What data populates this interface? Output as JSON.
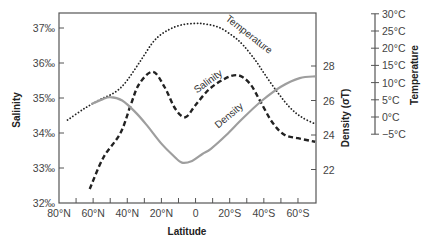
{
  "chart_data": {
    "type": "line",
    "title": "",
    "xlabel": "Latitude",
    "ylabel": "Salinity",
    "y2label": "Density (σT)",
    "y3label": "Temperature",
    "xlim": [
      80,
      -70
    ],
    "x_ticks": [
      {
        "value": 80,
        "label": "80°N"
      },
      {
        "value": 60,
        "label": "60°N"
      },
      {
        "value": 40,
        "label": "40°N"
      },
      {
        "value": 20,
        "label": "20°N"
      },
      {
        "value": 0,
        "label": "0"
      },
      {
        "value": -20,
        "label": "20°S"
      },
      {
        "value": -40,
        "label": "40°S"
      },
      {
        "value": -60,
        "label": "60°S"
      }
    ],
    "x_minor_ticks": [
      70,
      50,
      30,
      10,
      -10,
      -30,
      -50
    ],
    "salinity_axis": {
      "ylim": [
        32,
        37.4
      ],
      "ticks": [
        {
          "value": 37,
          "label": "37‰"
        },
        {
          "value": 36,
          "label": "36‰"
        },
        {
          "value": 35,
          "label": "35‰"
        },
        {
          "value": 34,
          "label": "34‰"
        },
        {
          "value": 33,
          "label": "33‰"
        },
        {
          "value": 32,
          "label": "32‰"
        }
      ]
    },
    "density_axis": {
      "ylim": [
        20,
        28
      ],
      "ticks": [
        {
          "value": 28,
          "label": "28"
        },
        {
          "value": 26,
          "label": "26"
        },
        {
          "value": 24,
          "label": "24"
        },
        {
          "value": 22,
          "label": "22"
        }
      ]
    },
    "temperature_axis": {
      "ylim": [
        -5,
        30
      ],
      "ticks": [
        {
          "value": 30,
          "label": "30°C"
        },
        {
          "value": 25,
          "label": "25°C"
        },
        {
          "value": 20,
          "label": "20°C"
        },
        {
          "value": 15,
          "label": "15°C"
        },
        {
          "value": 10,
          "label": "10°C"
        },
        {
          "value": 5,
          "label": "5°C"
        },
        {
          "value": 0,
          "label": "0°C"
        },
        {
          "value": -5,
          "label": "−5°C"
        }
      ]
    },
    "series": [
      {
        "name": "Temperature",
        "axis": "temperature",
        "style": "dotted",
        "color": "#222222",
        "x": [
          75,
          65,
          55,
          50,
          45,
          40,
          32,
          24,
          16,
          8,
          0,
          -6,
          -14,
          -22,
          -28,
          -35,
          -41,
          -48,
          -55,
          -62,
          -70
        ],
        "values": [
          -0.9,
          2.5,
          5.3,
          6.4,
          8.0,
          10.7,
          16.5,
          22.3,
          25.3,
          26.8,
          27.2,
          27.0,
          26.0,
          23.5,
          20.8,
          16.5,
          12.1,
          7.2,
          2.9,
          0.0,
          -2.0
        ]
      },
      {
        "name": "Salinity",
        "axis": "salinity",
        "style": "dashed",
        "color": "#222222",
        "x": [
          62,
          54,
          44,
          38,
          33,
          25,
          18,
          12,
          6,
          0,
          -8,
          -17,
          -25,
          -32,
          -38,
          -45,
          -52,
          -60,
          -70
        ],
        "values": [
          32.4,
          33.3,
          34.0,
          34.8,
          35.4,
          35.75,
          35.3,
          34.7,
          34.45,
          34.8,
          35.25,
          35.55,
          35.65,
          35.4,
          34.9,
          34.3,
          33.95,
          33.85,
          33.75
        ]
      },
      {
        "name": "Density",
        "axis": "density",
        "style": "solid",
        "color": "#9e9e9e",
        "x": [
          61,
          55,
          50,
          43,
          35,
          28,
          20,
          13,
          8,
          2,
          -4,
          -9,
          -18,
          -28,
          -39,
          -50,
          -61,
          -70
        ],
        "values": [
          25.8,
          26.05,
          26.2,
          26.0,
          25.3,
          24.5,
          23.5,
          22.8,
          22.4,
          22.5,
          22.9,
          23.2,
          24.0,
          25.0,
          26.0,
          26.8,
          27.3,
          27.4
        ]
      }
    ],
    "annotations": [
      {
        "text": "Temperature",
        "series": "Temperature"
      },
      {
        "text": "Salinity",
        "series": "Salinity"
      },
      {
        "text": "Density",
        "series": "Density"
      }
    ],
    "grid": false,
    "legend": "none (inline curve labels)"
  }
}
